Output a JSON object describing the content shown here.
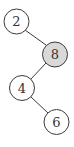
{
  "diagram": {
    "type": "binary-tree",
    "colors": {
      "stroke": "#3a3a3a",
      "default_fill": "#ffffff",
      "highlight_fill": "#d9d9d9",
      "text": "#333333"
    },
    "nodes": [
      {
        "id": "n2",
        "label": "2",
        "highlighted": false
      },
      {
        "id": "n8",
        "label": "8",
        "highlighted": true
      },
      {
        "id": "n4",
        "label": "4",
        "highlighted": false
      },
      {
        "id": "n6",
        "label": "6",
        "highlighted": false
      }
    ],
    "edges": [
      {
        "from": "2",
        "to": "8",
        "side": "right"
      },
      {
        "from": "8",
        "to": "4",
        "side": "left"
      },
      {
        "from": "4",
        "to": "6",
        "side": "right"
      }
    ]
  }
}
